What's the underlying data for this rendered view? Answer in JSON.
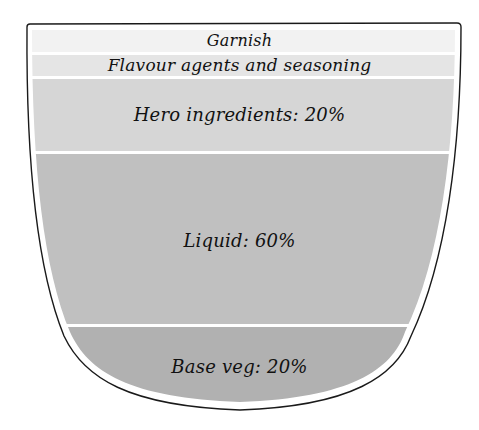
{
  "diagram": {
    "type": "soup-bowl-proportions",
    "outline_color": "#1a1a1a",
    "separator_color": "#ffffff",
    "layers": [
      {
        "id": "garnish",
        "label": "Garnish",
        "color": "#f2f2f2"
      },
      {
        "id": "flavour",
        "label": "Flavour agents and seasoning",
        "color": "#e5e5e5"
      },
      {
        "id": "hero",
        "label": "Hero ingredients: 20%",
        "color": "#d6d6d6"
      },
      {
        "id": "liquid",
        "label": "Liquid: 60%",
        "color": "#c0c0c0"
      },
      {
        "id": "base",
        "label": "Base veg: 20%",
        "color": "#b1b1b1"
      }
    ]
  }
}
